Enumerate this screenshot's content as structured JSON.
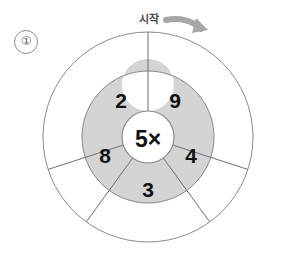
{
  "page": {
    "item_number": "①",
    "background_color": "#ffffff"
  },
  "start_marker": {
    "label": "시작",
    "arrow_icon": "curved-arrow-clockwise-icon",
    "arrow_color": "#a6a6a6"
  },
  "wheel": {
    "center_label": "5×",
    "outer_circle": {
      "stroke_color": "#8a8a8a",
      "fill_color": "#ffffff"
    },
    "inner_ring": {
      "fill_color": "#d4d4d4",
      "stroke_color": "#8a8a8a"
    },
    "hub": {
      "fill_color": "#ffffff",
      "stroke_color": "#8a8a8a"
    },
    "sector_count": 5,
    "sectors": [
      {
        "position": "top-right",
        "label": "9"
      },
      {
        "position": "right",
        "label": "4"
      },
      {
        "position": "bottom",
        "label": "3"
      },
      {
        "position": "left",
        "label": "8"
      },
      {
        "position": "top-left",
        "label": "2"
      }
    ]
  }
}
